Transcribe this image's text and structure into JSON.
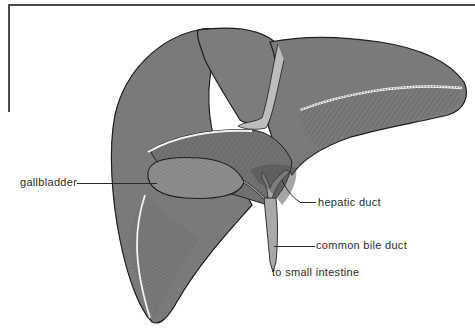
{
  "figure": {
    "colors": {
      "liver_fill": "#7a7a7a",
      "gallbladder_fill": "#8e8e8e",
      "duct_fill": "#a9a9a9",
      "outline": "#1e1e1e",
      "highlight": "#f2f2f2",
      "frame": "#4a4a4a",
      "label_text": "#2b2b2b"
    }
  },
  "labels": {
    "gallbladder": "gallbladder",
    "hepatic_duct": "hepatic duct",
    "common_bile_duct": "common bile duct",
    "to_small_intestine": "to small intestine"
  }
}
